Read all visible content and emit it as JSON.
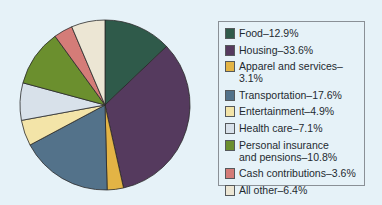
{
  "chart_data": {
    "type": "pie",
    "title": "",
    "legend_position": "right",
    "slices": [
      {
        "label": "Food",
        "value": 12.9,
        "text": "Food–12.9%",
        "color": "#2f5a4a"
      },
      {
        "label": "Housing",
        "value": 33.6,
        "text": "Housing–33.6%",
        "color": "#553a5e"
      },
      {
        "label": "Apparel and services",
        "value": 3.1,
        "text": "Apparel and services–3.1%",
        "color": "#e3b445"
      },
      {
        "label": "Transportation",
        "value": 17.6,
        "text": "Transportation–17.6%",
        "color": "#53728a"
      },
      {
        "label": "Entertainment",
        "value": 4.9,
        "text": "Entertainment–4.9%",
        "color": "#f3e4a8"
      },
      {
        "label": "Health care",
        "value": 7.1,
        "text": "Health care–7.1%",
        "color": "#d8e1ea"
      },
      {
        "label": "Personal insurance and pensions",
        "value": 10.8,
        "text": "Personal insurance\nand pensions–10.8%",
        "color": "#6b8f2e"
      },
      {
        "label": "Cash contributions",
        "value": 3.6,
        "text": "Cash contributions–3.6%",
        "color": "#d47c78"
      },
      {
        "label": "All other",
        "value": 6.4,
        "text": "All other–6.4%",
        "color": "#ece6d4"
      }
    ]
  }
}
